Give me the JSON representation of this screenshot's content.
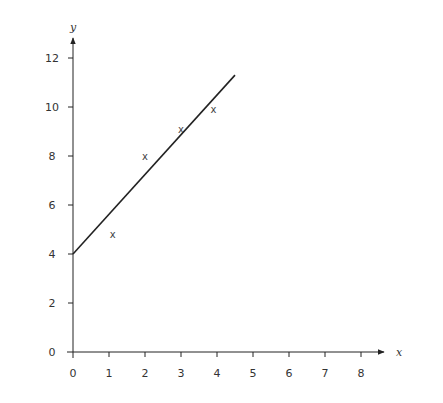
{
  "chart_data": {
    "type": "scatter",
    "title": "",
    "xlabel": "x",
    "ylabel": "y",
    "xlim": [
      0,
      8
    ],
    "ylim": [
      0,
      12
    ],
    "x_ticks": [
      0,
      1,
      2,
      3,
      4,
      5,
      6,
      7,
      8
    ],
    "y_ticks": [
      0,
      2,
      4,
      6,
      8,
      10,
      12
    ],
    "grid": false,
    "legend": null,
    "marker_symbol": "x",
    "series": [
      {
        "name": "data points",
        "type": "scatter",
        "points": [
          {
            "x": 1.1,
            "y": 4.8
          },
          {
            "x": 2.0,
            "y": 8.0
          },
          {
            "x": 3.0,
            "y": 9.1
          },
          {
            "x": 3.9,
            "y": 9.9
          }
        ]
      },
      {
        "name": "line of best fit",
        "type": "line",
        "points": [
          {
            "x": 0,
            "y": 4.0
          },
          {
            "x": 4.5,
            "y": 11.3
          }
        ]
      }
    ]
  }
}
